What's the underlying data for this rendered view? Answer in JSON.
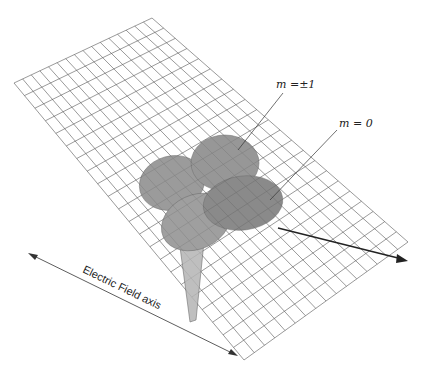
{
  "figure": {
    "type": "3d-orbital-diagram",
    "labels": {
      "m_pm1": "m =±1",
      "m_0": "m = 0",
      "axis": "Electric Field axis"
    },
    "colors": {
      "grid": "#555555",
      "lobe_fill": "#8a8a8a",
      "lobe_dark": "#6e6e6e",
      "stem_fill": "#b0b0b0",
      "arrow": "#222222",
      "background": "#ffffff"
    },
    "grid": {
      "corners": [
        [
          152,
          18
        ],
        [
          408,
          242
        ],
        [
          244,
          360
        ],
        [
          14,
          83
        ]
      ],
      "divisions_u": 22,
      "divisions_v": 16
    }
  }
}
